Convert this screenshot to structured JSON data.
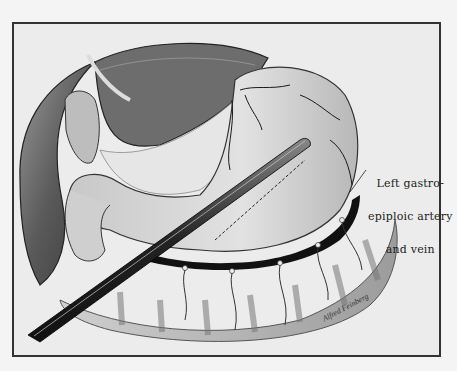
{
  "illustration": {
    "subject": "Surgical illustration of stomach with tube along greater curvature",
    "label": {
      "lines": [
        "Left gastro-",
        "epiploic artery",
        "and vein"
      ]
    },
    "signature": "Alfred Feinberg",
    "colors": {
      "background": "#f4f4f4",
      "frame": "#333333",
      "ink": "#1a1a1a"
    }
  }
}
